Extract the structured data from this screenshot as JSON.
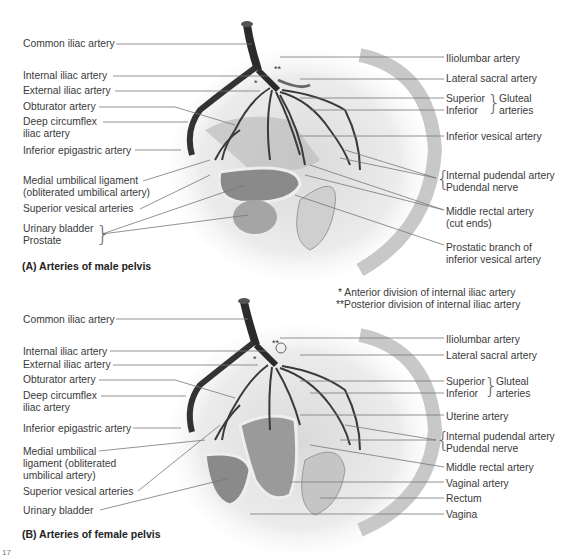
{
  "panelA": {
    "caption": "(A) Arteries of male pelvis",
    "left_labels": [
      {
        "text": "Common iliac artery",
        "x": 23,
        "y": 38
      },
      {
        "text": "Internal iliac artery",
        "x": 23,
        "y": 70
      },
      {
        "text": "External iliac artery",
        "x": 23,
        "y": 85
      },
      {
        "text": "Obturator artery",
        "x": 23,
        "y": 101
      },
      {
        "text": "Deep circumflex",
        "x": 23,
        "y": 116
      },
      {
        "text": "iliac artery",
        "x": 23,
        "y": 128
      },
      {
        "text": "Inferior epigastric artery",
        "x": 23,
        "y": 145
      },
      {
        "text": "Medial umbilical ligament",
        "x": 23,
        "y": 175
      },
      {
        "text": "(obliterated umbilical artery)",
        "x": 23,
        "y": 187
      },
      {
        "text": "Superior vesical arteries",
        "x": 23,
        "y": 203
      },
      {
        "text": "Urinary bladder",
        "x": 23,
        "y": 223
      },
      {
        "text": "Prostate",
        "x": 23,
        "y": 235
      }
    ],
    "right_labels": [
      {
        "text": "Iliolumbar artery",
        "x": 446,
        "y": 53
      },
      {
        "text": "Lateral sacral artery",
        "x": 446,
        "y": 73
      },
      {
        "text": "Superior",
        "x": 446,
        "y": 93
      },
      {
        "text": "Inferior",
        "x": 446,
        "y": 105
      },
      {
        "text": "Gluteal",
        "x": 499,
        "y": 93
      },
      {
        "text": "arteries",
        "x": 499,
        "y": 105
      },
      {
        "text": "Inferior vesical artery",
        "x": 446,
        "y": 131
      },
      {
        "text": "Internal pudendal artery",
        "x": 446,
        "y": 170
      },
      {
        "text": "Pudendal nerve",
        "x": 446,
        "y": 182
      },
      {
        "text": "Middle rectal artery",
        "x": 446,
        "y": 206
      },
      {
        "text": "(cut ends)",
        "x": 446,
        "y": 218
      },
      {
        "text": "Prostatic branch of",
        "x": 446,
        "y": 242
      },
      {
        "text": "inferior vesical artery",
        "x": 446,
        "y": 254
      }
    ]
  },
  "notes": {
    "anterior": "* Anterior division of internal iliac artery",
    "posterior": "**Posterior division of internal iliac artery"
  },
  "panelB": {
    "caption": "(B) Arteries of female pelvis",
    "left_labels": [
      {
        "text": "Common iliac artery",
        "x": 23,
        "y": 314
      },
      {
        "text": "Internal iliac artery",
        "x": 23,
        "y": 346
      },
      {
        "text": "External iliac artery",
        "x": 23,
        "y": 359
      },
      {
        "text": "Obturator artery",
        "x": 23,
        "y": 374
      },
      {
        "text": "Deep circumflex",
        "x": 23,
        "y": 390
      },
      {
        "text": "iliac artery",
        "x": 23,
        "y": 402
      },
      {
        "text": "Inferior epigastric artery",
        "x": 23,
        "y": 423
      },
      {
        "text": "Medial umbilical",
        "x": 23,
        "y": 446
      },
      {
        "text": "ligament (obliterated",
        "x": 23,
        "y": 458
      },
      {
        "text": "umbilical artery)",
        "x": 23,
        "y": 470
      },
      {
        "text": "Superior vesical arteries",
        "x": 23,
        "y": 486
      },
      {
        "text": "Urinary bladder",
        "x": 23,
        "y": 505
      }
    ],
    "right_labels": [
      {
        "text": "Iliolumbar artery",
        "x": 446,
        "y": 334
      },
      {
        "text": "Lateral sacral artery",
        "x": 446,
        "y": 350
      },
      {
        "text": "Superior",
        "x": 446,
        "y": 376
      },
      {
        "text": "Inferior",
        "x": 446,
        "y": 388
      },
      {
        "text": "Gluteal",
        "x": 496,
        "y": 376
      },
      {
        "text": "arteries",
        "x": 496,
        "y": 388
      },
      {
        "text": "Uterine artery",
        "x": 446,
        "y": 411
      },
      {
        "text": "Internal pudendal artery",
        "x": 446,
        "y": 431
      },
      {
        "text": "Pudendal nerve",
        "x": 446,
        "y": 443
      },
      {
        "text": "Middle rectal artery",
        "x": 446,
        "y": 462
      },
      {
        "text": "Vaginal artery",
        "x": 446,
        "y": 478
      },
      {
        "text": "Rectum",
        "x": 446,
        "y": 493
      },
      {
        "text": "Vagina",
        "x": 446,
        "y": 509
      }
    ]
  },
  "page_fragment": "17"
}
